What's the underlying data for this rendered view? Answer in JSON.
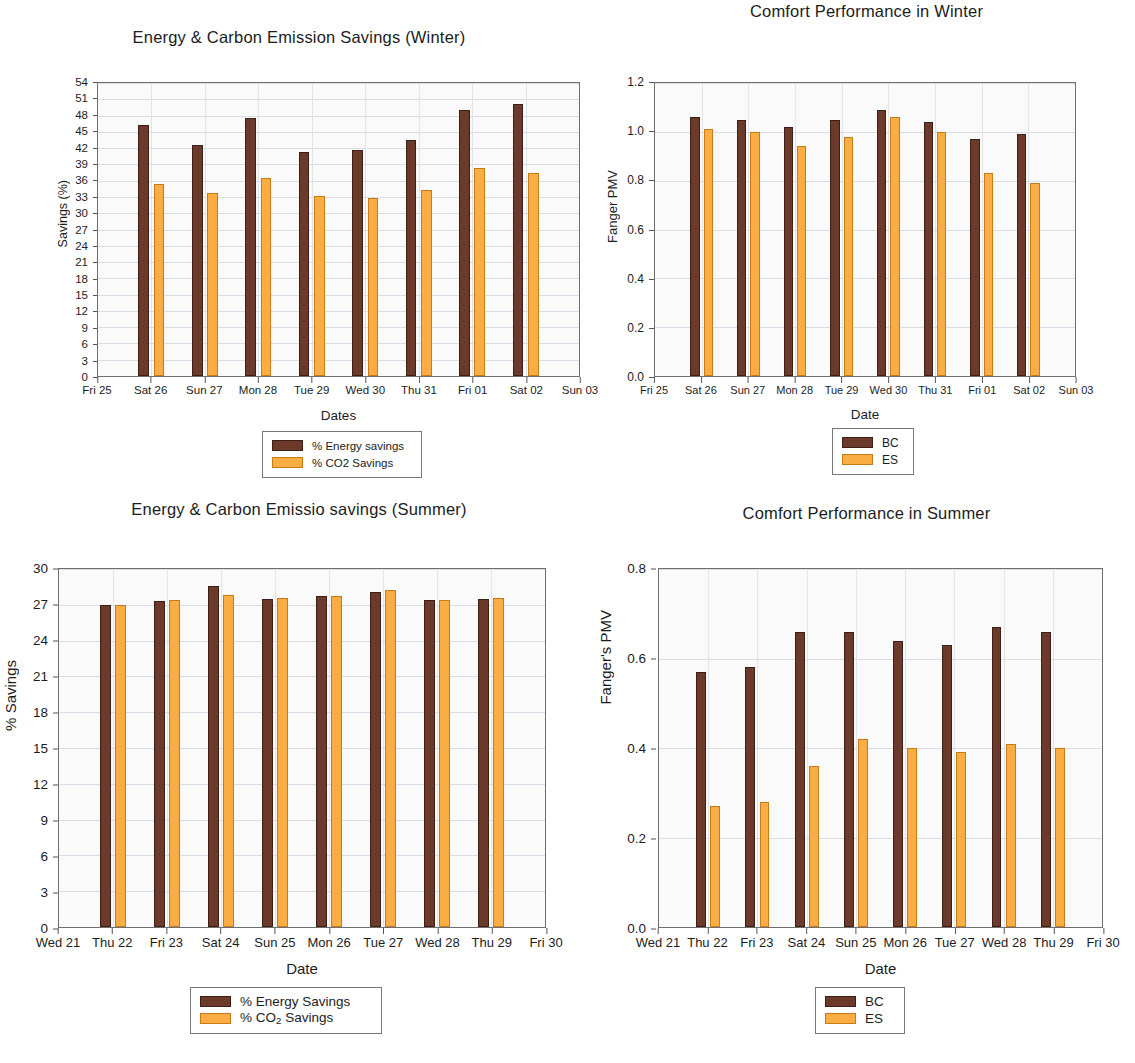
{
  "colors": {
    "bc": "#6b3a2b",
    "es": "#f9ad43",
    "plot_bg": "#fafafa",
    "grid": "#d8dde6"
  },
  "charts": [
    {
      "id": "winter-energy-savings",
      "title": "Energy & Carbon Emission Savings (Winter)",
      "chart_data": {
        "type": "bar",
        "title": "Energy & Carbon Emission Savings (Winter)",
        "xlabel": "Dates",
        "ylabel": "Savings (%)",
        "ylim": [
          0,
          54
        ],
        "ytick_step": 3,
        "yticks": [
          "0",
          "3",
          "6",
          "9",
          "12",
          "15",
          "18",
          "21",
          "24",
          "27",
          "30",
          "33",
          "36",
          "39",
          "42",
          "45",
          "48",
          "51",
          "54"
        ],
        "categories": [
          "Fri 25",
          "Sat 26",
          "Sun 27",
          "Mon 28",
          "Tue 29",
          "Wed 30",
          "Thu 31",
          "Fri 01",
          "Sat 02",
          "Sun 03"
        ],
        "bar_categories": [
          "Sat 26",
          "Sun 27",
          "Mon 28",
          "Tue 29",
          "Wed 30",
          "Thu 31",
          "Fri 01",
          "Sat 02"
        ],
        "grid": true,
        "legend_position": "below",
        "series": [
          {
            "name": "% Energy savings",
            "color": "#6b3a2b",
            "values": [
              46.3,
              42.6,
              47.6,
              41.2,
              41.6,
              43.5,
              49.1,
              50.1
            ]
          },
          {
            "name": "% CO2 Savings",
            "color": "#f9ad43",
            "values": [
              35.3,
              33.7,
              36.5,
              33.1,
              32.8,
              34.2,
              38.4,
              37.4
            ]
          }
        ]
      },
      "legend": [
        {
          "label": "% Energy savings",
          "swatch": "bc"
        },
        {
          "label": "% CO2 Savings",
          "swatch": "es"
        }
      ]
    },
    {
      "id": "winter-comfort-performance",
      "title": "Comfort  Performance in Winter",
      "chart_data": {
        "type": "bar",
        "title": "Comfort  Performance in Winter",
        "xlabel": "Date",
        "ylabel": "Fanger PMV",
        "ylim": [
          0.0,
          1.2
        ],
        "ytick_step": 0.2,
        "yticks": [
          "0.0",
          "0.2",
          "0.4",
          "0.6",
          "0.8",
          "1.0",
          "1.2"
        ],
        "categories": [
          "Fri 25",
          "Sat 26",
          "Sun 27",
          "Mon 28",
          "Tue 29",
          "Wed 30",
          "Thu 31",
          "Fri 01",
          "Sat 02",
          "Sun 03"
        ],
        "bar_categories": [
          "Sat 26",
          "Sun 27",
          "Mon 28",
          "Tue 29",
          "Wed 30",
          "Thu 31",
          "Fri 01",
          "Sat 02"
        ],
        "grid": true,
        "legend_position": "below",
        "series": [
          {
            "name": "BC",
            "color": "#6b3a2b",
            "values": [
              1.06,
              1.05,
              1.02,
              1.05,
              1.09,
              1.04,
              0.97,
              0.99
            ]
          },
          {
            "name": "ES",
            "color": "#f9ad43",
            "values": [
              1.01,
              1.0,
              0.94,
              0.98,
              1.06,
              1.0,
              0.83,
              0.79
            ]
          }
        ]
      },
      "legend": [
        {
          "label": "BC",
          "swatch": "bc"
        },
        {
          "label": "ES",
          "swatch": "es"
        }
      ]
    },
    {
      "id": "summer-energy-savings",
      "title": "Energy & Carbon Emissio savings (Summer)",
      "chart_data": {
        "type": "bar",
        "title": "Energy & Carbon Emissio savings (Summer)",
        "xlabel": "Date",
        "ylabel": "% Savings",
        "ylim": [
          0,
          30
        ],
        "ytick_step": 3,
        "yticks": [
          "0",
          "3",
          "6",
          "9",
          "12",
          "15",
          "18",
          "21",
          "24",
          "27",
          "30"
        ],
        "categories": [
          "Wed 21",
          "Thu 22",
          "Fri 23",
          "Sat 24",
          "Sun 25",
          "Mon 26",
          "Tue 27",
          "Wed 28",
          "Thu 29",
          "Fri 30"
        ],
        "bar_categories": [
          "Thu 22",
          "Fri 23",
          "Sat 24",
          "Sun 25",
          "Mon 26",
          "Tue 27",
          "Wed 28",
          "Thu 29"
        ],
        "grid": true,
        "legend_position": "below",
        "series": [
          {
            "name": "% Energy Savings",
            "color": "#6b3a2b",
            "values": [
              27.0,
              27.3,
              28.6,
              27.5,
              27.7,
              28.1,
              27.4,
              27.5
            ]
          },
          {
            "name": "% CO2 Savings",
            "color": "#f9ad43",
            "values": [
              27.0,
              27.4,
              27.8,
              27.6,
              27.7,
              28.2,
              27.4,
              27.6
            ]
          }
        ]
      },
      "legend": [
        {
          "label": "% Energy Savings",
          "swatch": "bc"
        },
        {
          "label": "% CO2 Savings",
          "swatch": "es",
          "subscript": true
        }
      ]
    },
    {
      "id": "summer-comfort-performance",
      "title": "Comfort Performance in Summer",
      "chart_data": {
        "type": "bar",
        "title": "Comfort Performance in Summer",
        "xlabel": "Date",
        "ylabel": "Fanger's PMV",
        "ylim": [
          0.0,
          0.8
        ],
        "ytick_step": 0.2,
        "yticks": [
          "0.0",
          "0.2",
          "0.4",
          "0.6",
          "0.8"
        ],
        "categories": [
          "Wed 21",
          "Thu 22",
          "Fri 23",
          "Sat 24",
          "Sun 25",
          "Mon 26",
          "Tue 27",
          "Wed 28",
          "Thu 29",
          "Fri 30"
        ],
        "bar_categories": [
          "Thu 22",
          "Fri 23",
          "Sat 24",
          "Sun 25",
          "Mon 26",
          "Tue 27",
          "Wed 28",
          "Thu 29"
        ],
        "grid": true,
        "legend_position": "below",
        "series": [
          {
            "name": "BC",
            "color": "#6b3a2b",
            "values": [
              0.57,
              0.58,
              0.66,
              0.66,
              0.64,
              0.63,
              0.67,
              0.66
            ]
          },
          {
            "name": "ES",
            "color": "#f9ad43",
            "values": [
              0.27,
              0.28,
              0.36,
              0.42,
              0.4,
              0.39,
              0.41,
              0.4
            ]
          }
        ]
      },
      "legend": [
        {
          "label": "BC",
          "swatch": "bc"
        },
        {
          "label": "ES",
          "swatch": "es"
        }
      ]
    }
  ]
}
